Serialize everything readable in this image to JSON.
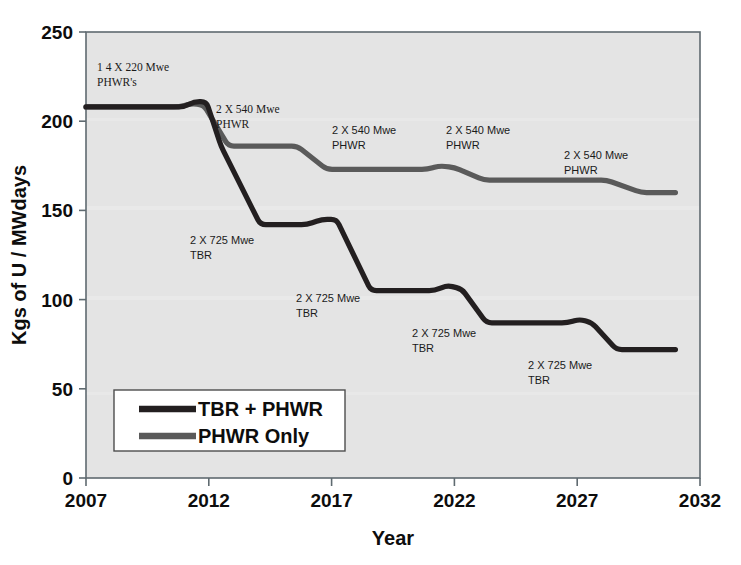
{
  "chart_data": {
    "type": "line",
    "title": "",
    "xlabel": "Year",
    "ylabel": "Kgs of U / MWdays",
    "xlim": [
      2007,
      2032
    ],
    "ylim": [
      0,
      250
    ],
    "xticks": [
      "2007",
      "2012",
      "2017",
      "2022",
      "2027",
      "2032"
    ],
    "yticks": [
      "0",
      "50",
      "100",
      "150",
      "200",
      "250"
    ],
    "grid": false,
    "legend_position": "lower-left",
    "series": [
      {
        "name": "TBR + PHWR",
        "color": "#231f20",
        "points": [
          {
            "x": 2007.0,
            "y": 208
          },
          {
            "x": 2011.0,
            "y": 208
          },
          {
            "x": 2011.4,
            "y": 211
          },
          {
            "x": 2011.9,
            "y": 211
          },
          {
            "x": 2012.5,
            "y": 186
          },
          {
            "x": 2014.1,
            "y": 142
          },
          {
            "x": 2016.0,
            "y": 142
          },
          {
            "x": 2016.6,
            "y": 145
          },
          {
            "x": 2017.2,
            "y": 145
          },
          {
            "x": 2018.6,
            "y": 105
          },
          {
            "x": 2021.2,
            "y": 105
          },
          {
            "x": 2021.7,
            "y": 108
          },
          {
            "x": 2022.3,
            "y": 106
          },
          {
            "x": 2023.3,
            "y": 87
          },
          {
            "x": 2026.6,
            "y": 87
          },
          {
            "x": 2027.1,
            "y": 89
          },
          {
            "x": 2027.6,
            "y": 87
          },
          {
            "x": 2028.6,
            "y": 72
          },
          {
            "x": 2031.0,
            "y": 72
          }
        ]
      },
      {
        "name": "PHWR Only",
        "color": "#5a5a5a",
        "points": [
          {
            "x": 2007.0,
            "y": 208
          },
          {
            "x": 2010.8,
            "y": 208
          },
          {
            "x": 2011.3,
            "y": 210
          },
          {
            "x": 2011.8,
            "y": 209
          },
          {
            "x": 2012.8,
            "y": 186
          },
          {
            "x": 2015.6,
            "y": 186
          },
          {
            "x": 2016.8,
            "y": 173
          },
          {
            "x": 2020.9,
            "y": 173
          },
          {
            "x": 2021.4,
            "y": 175
          },
          {
            "x": 2022.0,
            "y": 174
          },
          {
            "x": 2023.2,
            "y": 167
          },
          {
            "x": 2028.2,
            "y": 167
          },
          {
            "x": 2029.6,
            "y": 160
          },
          {
            "x": 2031.0,
            "y": 160
          }
        ]
      }
    ],
    "annotations": [
      {
        "id": "ann-phwr-14x220",
        "line1": "1 4  X  220 Mwe",
        "line2": "PHWR's",
        "x": 97,
        "y": 71,
        "style": "serif"
      },
      {
        "id": "ann-phwr-540-1",
        "line1": "2 X 540 Mwe",
        "line2": "PHWR",
        "x": 216,
        "y": 113,
        "style": "serif"
      },
      {
        "id": "ann-phwr-540-2",
        "line1": "2 X 540 Mwe",
        "line2": "PHWR",
        "x": 332,
        "y": 134,
        "style": "sans"
      },
      {
        "id": "ann-phwr-540-3",
        "line1": "2 X 540 Mwe",
        "line2": "PHWR",
        "x": 446,
        "y": 134,
        "style": "sans"
      },
      {
        "id": "ann-phwr-540-4",
        "line1": "2 X 540 Mwe",
        "line2": "PHWR",
        "x": 564,
        "y": 159,
        "style": "sans"
      },
      {
        "id": "ann-tbr-725-1",
        "line1": "2 X 725 Mwe",
        "line2": "TBR",
        "x": 190,
        "y": 244,
        "style": "sans"
      },
      {
        "id": "ann-tbr-725-2",
        "line1": "2 X 725 Mwe",
        "line2": "TBR",
        "x": 296,
        "y": 302,
        "style": "sans"
      },
      {
        "id": "ann-tbr-725-3",
        "line1": "2 X 725 Mwe",
        "line2": "TBR",
        "x": 412,
        "y": 337,
        "style": "sans"
      },
      {
        "id": "ann-tbr-725-4",
        "line1": "2 X 725 Mwe",
        "line2": "TBR",
        "x": 528,
        "y": 369,
        "style": "sans"
      }
    ],
    "legend_entries": [
      {
        "label": "TBR + PHWR",
        "color": "#231f20"
      },
      {
        "label": "PHWR Only",
        "color": "#5a5a5a"
      }
    ]
  },
  "plot": {
    "background_color": "#e4e4e4",
    "border_color": "#5f6a70",
    "legend_background": "#ffffff",
    "legend_border": "#4d4d4d"
  }
}
